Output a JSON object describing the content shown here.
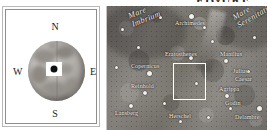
{
  "figure": {
    "caption_fragment": "FIGURE"
  },
  "locator_panel": {
    "name": "moon-globe-locator",
    "compass": {
      "north": "N",
      "south": "S",
      "east": "E",
      "west": "W"
    },
    "marker": {
      "name": "region-of-interest-marker",
      "shape": "white-square-with-black-dot"
    }
  },
  "lunar_map": {
    "name": "lunar-surface-detail-map",
    "inset_rect": {
      "label": "detail-selection-rectangle",
      "color": "#ffffff",
      "x": 66,
      "y": 57,
      "w": 33,
      "h": 37
    },
    "maria": [
      {
        "label": "Mare Imbrium",
        "x": 20,
        "y": 6,
        "rotate": -22
      },
      {
        "label": "Mare Serenitatis",
        "x": 124,
        "y": 8,
        "rotate": -30
      }
    ],
    "features": [
      {
        "label": "Archimedes",
        "lx": 68,
        "ly": 14,
        "cx": 82,
        "cy": 8,
        "size": "lg"
      },
      {
        "label": "Eratosthenes",
        "lx": 58,
        "ly": 45,
        "cx": 82,
        "cy": 50,
        "size": "md"
      },
      {
        "label": "Copernicus",
        "lx": 24,
        "ly": 57,
        "cx": 40,
        "cy": 65,
        "size": "lg"
      },
      {
        "label": "Manilius",
        "lx": 113,
        "ly": 45,
        "cx": 117,
        "cy": 53,
        "size": "md"
      },
      {
        "label": "Julius",
        "lx": 126,
        "ly": 62,
        "cx": 0,
        "cy": 0,
        "size": "none"
      },
      {
        "label": "Caesar",
        "lx": 128,
        "ly": 70,
        "cx": 0,
        "cy": 0,
        "size": "none"
      },
      {
        "label": "Agrippa",
        "lx": 112,
        "ly": 80,
        "cx": 118,
        "cy": 88,
        "size": "md"
      },
      {
        "label": "Godin",
        "lx": 118,
        "ly": 94,
        "cx": 122,
        "cy": 101,
        "size": "sm"
      },
      {
        "label": "Reinhold",
        "lx": 24,
        "ly": 77,
        "cx": 36,
        "cy": 85,
        "size": "md"
      },
      {
        "label": "Lansberg",
        "lx": 8,
        "ly": 104,
        "cx": 22,
        "cy": 98,
        "size": "md"
      },
      {
        "label": "Herschel",
        "lx": 62,
        "ly": 107,
        "cx": 72,
        "cy": 114,
        "size": "sm"
      },
      {
        "label": "Delambre",
        "lx": 128,
        "ly": 108,
        "cx": 0,
        "cy": 0,
        "size": "none"
      }
    ],
    "extra_craters": [
      {
        "cx": 14,
        "cy": 22,
        "size": "sm"
      },
      {
        "cx": 52,
        "cy": 10,
        "size": "sm"
      },
      {
        "cx": 96,
        "cy": 20,
        "size": "sm"
      },
      {
        "cx": 146,
        "cy": 30,
        "size": "sm"
      },
      {
        "cx": 30,
        "cy": 40,
        "size": "sm"
      },
      {
        "cx": 104,
        "cy": 34,
        "size": "sm"
      },
      {
        "cx": 140,
        "cy": 64,
        "size": "sm"
      },
      {
        "cx": 56,
        "cy": 96,
        "size": "sm"
      },
      {
        "cx": 100,
        "cy": 110,
        "size": "sm"
      },
      {
        "cx": 150,
        "cy": 100,
        "size": "lg"
      },
      {
        "cx": 8,
        "cy": 60,
        "size": "sm"
      },
      {
        "cx": 88,
        "cy": 76,
        "size": "sm"
      }
    ]
  }
}
